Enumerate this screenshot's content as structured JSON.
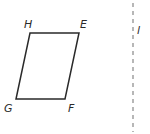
{
  "diagram": {
    "type": "geometry",
    "shape": "parallelogram",
    "vertices": [
      {
        "label": "H",
        "x": 30,
        "y": 33,
        "lx": 24,
        "ly": 28
      },
      {
        "label": "E",
        "x": 79,
        "y": 33,
        "lx": 80,
        "ly": 28
      },
      {
        "label": "F",
        "x": 65,
        "y": 99,
        "lx": 68,
        "ly": 112
      },
      {
        "label": "G",
        "x": 16,
        "y": 99,
        "lx": 4,
        "ly": 112
      }
    ],
    "line": {
      "label": "l",
      "x": 133,
      "y1": 3,
      "y2": 132,
      "style": "dashed",
      "lx": 137,
      "ly": 34
    },
    "stroke_color": "#2a2a2a",
    "dash_color": "#888888"
  }
}
